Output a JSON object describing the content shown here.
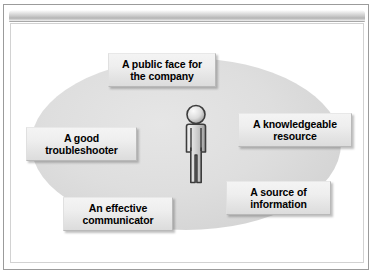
{
  "slide": {
    "title_strip_label": "",
    "background_color": "#ffffff",
    "frame_border_color": "#9b9b9b"
  },
  "diagram": {
    "type": "radial-callout",
    "center": {
      "icon": "person-icon",
      "label": "",
      "description": "3D shaded human figure silhouette standing facing forward"
    },
    "ellipse": {
      "name": "background-ellipse",
      "fill_color": "#dedede"
    },
    "callouts": [
      {
        "id": "public-face",
        "line1": "A public face for",
        "line2": "the company",
        "position": "top"
      },
      {
        "id": "knowledgeable",
        "line1": "A knowledgeable",
        "line2": "resource",
        "position": "right"
      },
      {
        "id": "troubleshooter",
        "line1": "A good",
        "line2": "troubleshooter",
        "position": "left"
      },
      {
        "id": "source-information",
        "line1": "A source of",
        "line2": "information",
        "position": "bottom-right"
      },
      {
        "id": "communicator",
        "line1": "An effective",
        "line2": "communicator",
        "position": "bottom-left"
      }
    ]
  },
  "colors": {
    "callout_fill": "#eeeeee",
    "callout_border": "#b9b9b9",
    "text": "#000000",
    "ellipse": "#dedede",
    "title_strip": "#c9c9c9"
  }
}
